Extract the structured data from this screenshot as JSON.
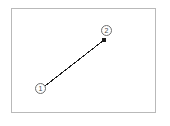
{
  "figure": {
    "type": "annotated-line-diagram",
    "background_color": "#ffffff",
    "frame": {
      "name": "diagram-frame",
      "border_color": "#b9b9b9",
      "fill_color": "#ffffff",
      "x": 11,
      "y": 8,
      "width": 145,
      "height": 105
    },
    "line": {
      "name": "drag-path",
      "color": "#1c1c1c",
      "width": 1,
      "start": {
        "x": 45,
        "y": 86
      },
      "end": {
        "x": 104,
        "y": 40
      }
    },
    "endpoint_dot": {
      "name": "endpoint-dot",
      "color": "#1c1c1c",
      "x": 104,
      "y": 40,
      "size": 4
    },
    "annotations": [
      {
        "name": "step-badge-1",
        "label": "1",
        "x": 35,
        "y": 83,
        "circle_color": "#6e6e6e",
        "text_color": "#4a4a4a"
      },
      {
        "name": "step-badge-2",
        "label": "2",
        "x": 101,
        "y": 25,
        "circle_color": "#6e6e6e",
        "text_color": "#4a4a4a"
      }
    ]
  }
}
